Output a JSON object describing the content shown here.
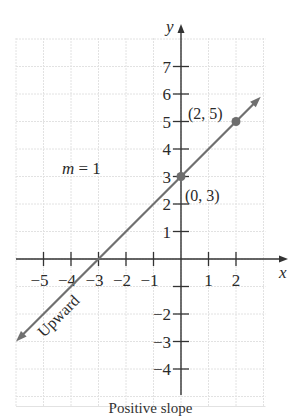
{
  "chart_data": {
    "type": "line",
    "title": "",
    "xlabel": "x",
    "ylabel": "y",
    "xlim": [
      -6,
      3
    ],
    "ylim": [
      -5,
      8
    ],
    "grid": true,
    "x_ticks": [
      -5,
      -4,
      -3,
      -2,
      -1,
      1,
      2
    ],
    "x_tick_labels": [
      "−5",
      "−4",
      "−3",
      "−2",
      "−1",
      "1",
      "2"
    ],
    "y_ticks": [
      7,
      6,
      5,
      4,
      3,
      2,
      1,
      -1,
      -2,
      -3,
      -4
    ],
    "y_tick_labels": [
      "7",
      "6",
      "5",
      "4",
      "3",
      "2",
      "1",
      "",
      "−2",
      "−3",
      "−4"
    ],
    "series": [
      {
        "name": "y = x + 3",
        "equation": "y = x + 3",
        "slope": 1,
        "intercept": 3,
        "x": [
          -6,
          2.9
        ],
        "y": [
          -3,
          5.9
        ],
        "arrows": "both",
        "color": "#707070"
      }
    ],
    "points": [
      {
        "x": 0,
        "y": 3,
        "label": "(0, 3)"
      },
      {
        "x": 2,
        "y": 5,
        "label": "(2, 5)"
      }
    ],
    "annotations": [
      {
        "text": "m = 1",
        "x": -4.2,
        "y": 3.5
      },
      {
        "text": "Upward",
        "x": -4.9,
        "y": -1.9,
        "rotation": -45
      }
    ]
  },
  "labels": {
    "x_axis": "x",
    "y_axis": "y",
    "slope": "m = 1",
    "slope_m": "m",
    "slope_eq": " = 1",
    "direction": "Upward",
    "point_a": "(0, 3)",
    "point_b": "(2, 5)",
    "caption": "Positive slope"
  },
  "colors": {
    "axis": "#333333",
    "grid": "#e2e2e2",
    "line": "#707070",
    "point": "#6e6e6e"
  }
}
